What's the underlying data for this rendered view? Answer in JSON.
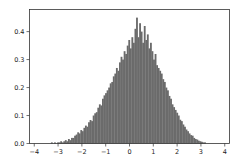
{
  "chart_data": {
    "type": "bar",
    "title": "",
    "xlabel": "",
    "ylabel": "",
    "xlim": [
      -4.2,
      4.2
    ],
    "ylim": [
      0,
      0.479
    ],
    "xticks": [
      -4,
      -3,
      -2,
      -1,
      0,
      1,
      2,
      3,
      4
    ],
    "xtick_labels": [
      "-4",
      "-3",
      "-2",
      "-1",
      "0",
      "1",
      "2",
      "3",
      "4"
    ],
    "yticks": [
      0.0,
      0.1,
      0.2,
      0.3,
      0.4
    ],
    "ytick_labels": [
      "0.0",
      "0.1",
      "0.2",
      "0.3",
      "0.4"
    ],
    "grid": false,
    "legend": null,
    "bar_color": "#6b6b6b",
    "bin_start": -3.3,
    "bin_width": 0.065,
    "density_values": [
      0.004,
      0.0,
      0.004,
      0.0,
      0.004,
      0.004,
      0.008,
      0.004,
      0.008,
      0.012,
      0.008,
      0.016,
      0.012,
      0.02,
      0.02,
      0.028,
      0.032,
      0.04,
      0.036,
      0.048,
      0.044,
      0.056,
      0.064,
      0.06,
      0.076,
      0.084,
      0.08,
      0.1,
      0.108,
      0.112,
      0.128,
      0.14,
      0.136,
      0.16,
      0.172,
      0.18,
      0.19,
      0.2,
      0.215,
      0.22,
      0.24,
      0.25,
      0.27,
      0.26,
      0.29,
      0.31,
      0.3,
      0.33,
      0.32,
      0.35,
      0.37,
      0.34,
      0.38,
      0.36,
      0.41,
      0.45,
      0.38,
      0.43,
      0.4,
      0.36,
      0.42,
      0.37,
      0.39,
      0.34,
      0.36,
      0.33,
      0.3,
      0.32,
      0.28,
      0.27,
      0.26,
      0.25,
      0.23,
      0.22,
      0.2,
      0.19,
      0.17,
      0.16,
      0.14,
      0.13,
      0.12,
      0.11,
      0.1,
      0.085,
      0.08,
      0.068,
      0.06,
      0.05,
      0.044,
      0.036,
      0.03,
      0.028,
      0.02,
      0.016,
      0.014,
      0.01,
      0.008,
      0.006,
      0.004,
      0.004
    ]
  }
}
